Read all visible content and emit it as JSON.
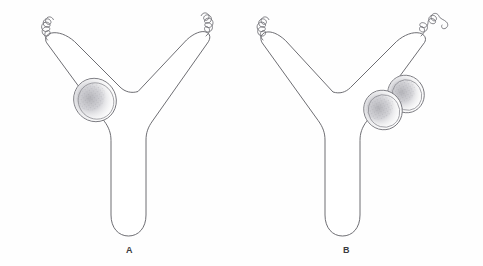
{
  "figure": {
    "title": "",
    "background_color": "#fefefe",
    "line_color": "#5d5d63",
    "stipple_color": "#8a8a90",
    "panels": [
      {
        "id": "panel-a",
        "label": "A",
        "label_x": 130,
        "label_y": 250,
        "description": "Y-shaped trilobed cell with a single ovoid nucleus in the upper-left arm and two flagella at the tips of the upper arms",
        "nuclei_count": 1,
        "flagella_count": 2,
        "nuclei": [
          {
            "cx": 95,
            "cy": 100,
            "rx": 21,
            "ry": 22,
            "rotation": -35
          }
        ],
        "flagella_positions": [
          "upper-left-tip",
          "upper-right-tip"
        ]
      },
      {
        "id": "panel-b",
        "label": "B",
        "label_x": 347,
        "label_y": 250,
        "description": "Y-shaped trilobed cell with a dividing nucleus shown as two overlapping ovoid bodies in the upper-right arm and two flagella at the tips of the upper arms",
        "nuclei_count": 2,
        "flagella_count": 2,
        "nuclei": [
          {
            "cx": 383,
            "cy": 110,
            "rx": 19,
            "ry": 20,
            "rotation": -30
          },
          {
            "cx": 406,
            "cy": 94,
            "rx": 18,
            "ry": 19,
            "rotation": -30
          }
        ],
        "flagella_positions": [
          "upper-left-tip",
          "upper-right-tip"
        ]
      }
    ]
  },
  "labels": {
    "a": "A",
    "b": "B"
  }
}
